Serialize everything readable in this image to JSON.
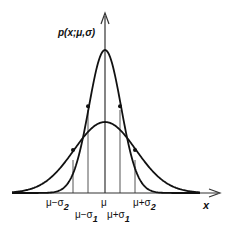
{
  "diagram": {
    "y_axis_label": "p(x;μ,σ)",
    "x_axis_label": "x",
    "curves": [
      {
        "name": "narrow",
        "sigma": "σ1",
        "description": "tall narrow Gaussian"
      },
      {
        "name": "wide",
        "sigma": "σ2",
        "description": "short wide Gaussian"
      }
    ],
    "tick_labels": {
      "mu_minus_sigma2": {
        "base": "μ−σ",
        "sub": "2"
      },
      "mu_minus_sigma1": {
        "base": "μ−σ",
        "sub": "1"
      },
      "mu": {
        "base": "μ",
        "sub": ""
      },
      "mu_plus_sigma1": {
        "base": "μ+σ",
        "sub": "1"
      },
      "mu_plus_sigma2": {
        "base": "μ+σ",
        "sub": "2"
      }
    },
    "colors": {
      "curve": "#111111",
      "guide": "#555555",
      "background": "#ffffff"
    }
  }
}
